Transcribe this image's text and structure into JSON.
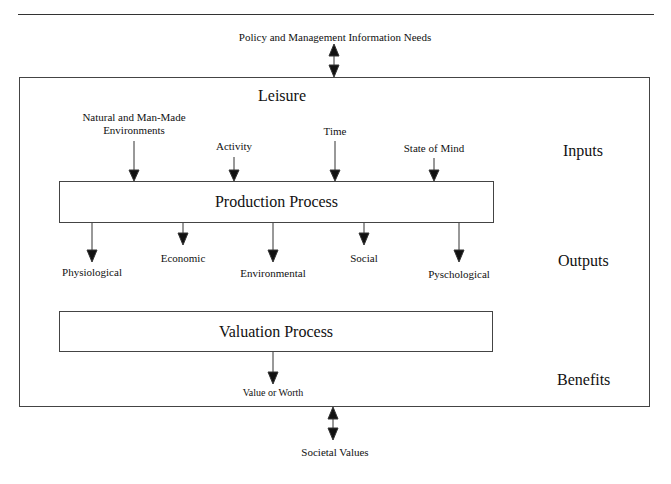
{
  "diagram": {
    "title": "Leisure",
    "top_external": "Policy and Management Information Needs",
    "bottom_external": "Societal Values",
    "row_labels": {
      "inputs": "Inputs",
      "outputs": "Outputs",
      "benefits": "Benefits"
    },
    "inputs": [
      {
        "line1": "Natural and Man-Made",
        "line2": "Environments"
      },
      {
        "line1": "Activity"
      },
      {
        "line1": "Time"
      },
      {
        "line1": "State of Mind"
      }
    ],
    "production_process": "Production Process",
    "outputs": [
      "Physiological",
      "Economic",
      "Environmental",
      "Social",
      "Pyschological"
    ],
    "valuation_process": "Valuation Process",
    "benefit": "Value or Worth",
    "colors": {
      "line": "#333333",
      "text": "#111111",
      "background": "#ffffff"
    }
  }
}
